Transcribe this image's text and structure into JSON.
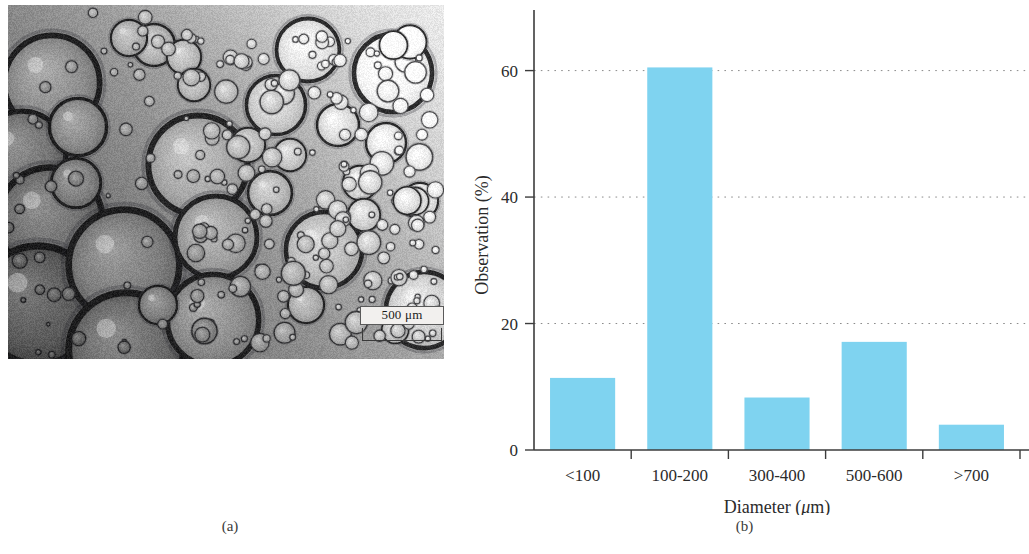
{
  "figure": {
    "panels": [
      {
        "id": "a",
        "caption": "(a)",
        "kind": "micrograph"
      },
      {
        "id": "b",
        "caption": "(b)",
        "kind": "bar-chart"
      }
    ]
  },
  "micrograph": {
    "alt_name": "emulsion-droplet-micrograph",
    "scalebar": {
      "label": "500 μm",
      "value": 500,
      "unit": "μm"
    }
  },
  "chart_data": {
    "type": "bar",
    "title": "",
    "categories": [
      "<100",
      "100-200",
      "300-400",
      "500-600",
      ">700"
    ],
    "values": [
      11.4,
      60.5,
      8.3,
      17.1,
      4.0
    ],
    "xlabel": "Diameter (μm)",
    "ylabel": "Observation (%)",
    "ylim": [
      0,
      68
    ],
    "yticks": [
      0,
      20,
      40,
      60
    ],
    "ytick_labels": [
      "0",
      "20",
      "40",
      "60"
    ],
    "grid": true,
    "grid_axis": "y",
    "legend": "none",
    "bar_color": "#7fd3f0",
    "axis_color": "#3c3c3c",
    "grid_color": "#8b8b8b"
  }
}
